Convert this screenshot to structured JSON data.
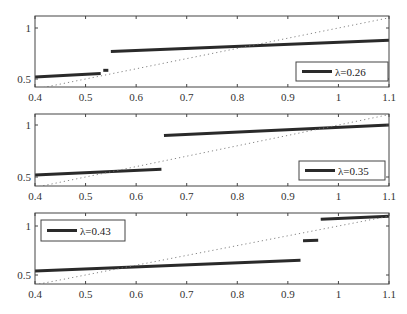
{
  "figure": {
    "width": 407,
    "height": 314,
    "colors": {
      "line": "#2a2a2a",
      "diagonal": "#777777",
      "axes": "#444444"
    }
  },
  "chart_data": [
    {
      "type": "line",
      "title": "",
      "xlabel": "",
      "ylabel": "",
      "xlim": [
        0.4,
        1.1
      ],
      "ylim": [
        0.43,
        1.13
      ],
      "xticks": [
        "0.4",
        "0.5",
        "0.6",
        "0.7",
        "0.8",
        "0.9",
        "1",
        "1.1"
      ],
      "yticks": [
        "0.5",
        "1"
      ],
      "legend": {
        "label": "λ=0.26",
        "position": "lower right"
      },
      "series": [
        {
          "name": "λ=0.26",
          "style": "solid",
          "segments": [
            [
              [
                0.4,
                0.52
              ],
              [
                0.53,
                0.555
              ]
            ],
            [
              [
                0.535,
                0.585
              ],
              [
                0.545,
                0.585
              ]
            ],
            [
              [
                0.55,
                0.77
              ],
              [
                1.1,
                0.88
              ]
            ]
          ]
        },
        {
          "name": "diagonal",
          "style": "dotted",
          "segments": [
            [
              [
                0.4,
                0.4
              ],
              [
                1.1,
                1.1
              ]
            ]
          ]
        }
      ]
    },
    {
      "type": "line",
      "title": "",
      "xlabel": "",
      "ylabel": "",
      "xlim": [
        0.4,
        1.1
      ],
      "ylim": [
        0.43,
        1.13
      ],
      "xticks": [
        "0.4",
        "0.5",
        "0.6",
        "0.7",
        "0.8",
        "0.9",
        "1",
        "1.1"
      ],
      "yticks": [
        "0.5",
        "1"
      ],
      "legend": {
        "label": "λ=0.35",
        "position": "lower right"
      },
      "series": [
        {
          "name": "λ=0.35",
          "style": "solid",
          "segments": [
            [
              [
                0.4,
                0.52
              ],
              [
                0.65,
                0.575
              ]
            ],
            [
              [
                0.655,
                0.9
              ],
              [
                1.1,
                1.0
              ]
            ]
          ]
        },
        {
          "name": "diagonal",
          "style": "dotted",
          "segments": [
            [
              [
                0.4,
                0.4
              ],
              [
                1.1,
                1.1
              ]
            ]
          ]
        }
      ]
    },
    {
      "type": "line",
      "title": "",
      "xlabel": "",
      "ylabel": "",
      "xlim": [
        0.4,
        1.1
      ],
      "ylim": [
        0.43,
        1.13
      ],
      "xticks": [
        "0.4",
        "0.5",
        "0.6",
        "0.7",
        "0.8",
        "0.9",
        "1",
        "1.1"
      ],
      "yticks": [
        "0.5",
        "1"
      ],
      "legend": {
        "label": "λ=0.43",
        "position": "upper left"
      },
      "series": [
        {
          "name": "λ=0.43",
          "style": "solid",
          "segments": [
            [
              [
                0.4,
                0.54
              ],
              [
                0.925,
                0.65
              ]
            ],
            [
              [
                0.93,
                0.85
              ],
              [
                0.96,
                0.855
              ]
            ],
            [
              [
                0.965,
                1.07
              ],
              [
                1.1,
                1.1
              ]
            ]
          ]
        },
        {
          "name": "diagonal",
          "style": "dotted",
          "segments": [
            [
              [
                0.4,
                0.4
              ],
              [
                1.1,
                1.1
              ]
            ]
          ]
        }
      ]
    }
  ],
  "panels": [
    {
      "box": {
        "top": 16,
        "bottom": 87
      },
      "y1px": 28,
      "y05px": 79,
      "legend": {
        "x": 296,
        "y": 62,
        "w": 92,
        "h": 19
      }
    },
    {
      "box": {
        "top": 114,
        "bottom": 186
      },
      "y1px": 125,
      "y05px": 177,
      "legend": {
        "x": 299,
        "y": 161,
        "w": 86,
        "h": 19
      }
    },
    {
      "box": {
        "top": 213,
        "bottom": 284
      },
      "y1px": 226,
      "y05px": 275,
      "legend": {
        "x": 41,
        "y": 220,
        "w": 84,
        "h": 21
      }
    }
  ],
  "axes_x": {
    "left": 35,
    "right": 389
  }
}
